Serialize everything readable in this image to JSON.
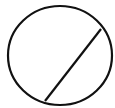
{
  "diagram": {
    "canvas": {
      "width": 115,
      "height": 108,
      "background": "#ffffff"
    },
    "stroke_color": "#111111",
    "stroke_width": 2.2,
    "circle": {
      "cx": 60,
      "cy": 55.5,
      "rx": 52,
      "ry": 49.5
    },
    "chord": {
      "x1": 45,
      "y1": 101,
      "x2": 101,
      "y2": 29
    }
  }
}
